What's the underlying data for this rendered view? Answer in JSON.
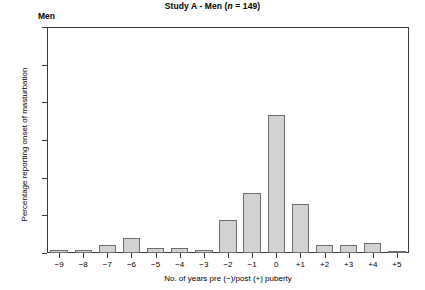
{
  "panel": {
    "label": "Men"
  },
  "chart_data": {
    "type": "bar",
    "title": "Study A - Men (n = 149)",
    "title_parts": {
      "prefix": "Study A - Men (",
      "italic": "n",
      "suffix": " = 149)"
    },
    "xlabel": "No. of years pre (−)/post (+) puberty",
    "ylabel": "Percentage reporting onset of masturbation",
    "categories": [
      "−9",
      "−8",
      "−7",
      "−6",
      "−5",
      "−4",
      "−3",
      "−2",
      "−1",
      "0",
      "+1",
      "+2",
      "+3",
      "+4",
      "+5"
    ],
    "values": [
      0.7,
      0.7,
      2.0,
      4.0,
      1.3,
      1.3,
      0.7,
      8.8,
      16.0,
      36.6,
      13.0,
      2.0,
      2.0,
      2.6,
      0.5
    ],
    "ylim": [
      0,
      60
    ],
    "yticks": [
      0,
      10,
      20,
      30,
      40,
      50,
      60
    ],
    "ytick_labels": [
      "0",
      "10",
      "20",
      "30",
      "40",
      "50",
      "60"
    ],
    "grid": false,
    "legend": false,
    "bar_fill": "#d2d2d2",
    "bar_edge": "#6e6e6e",
    "axis_color": "#3a3a3a"
  }
}
